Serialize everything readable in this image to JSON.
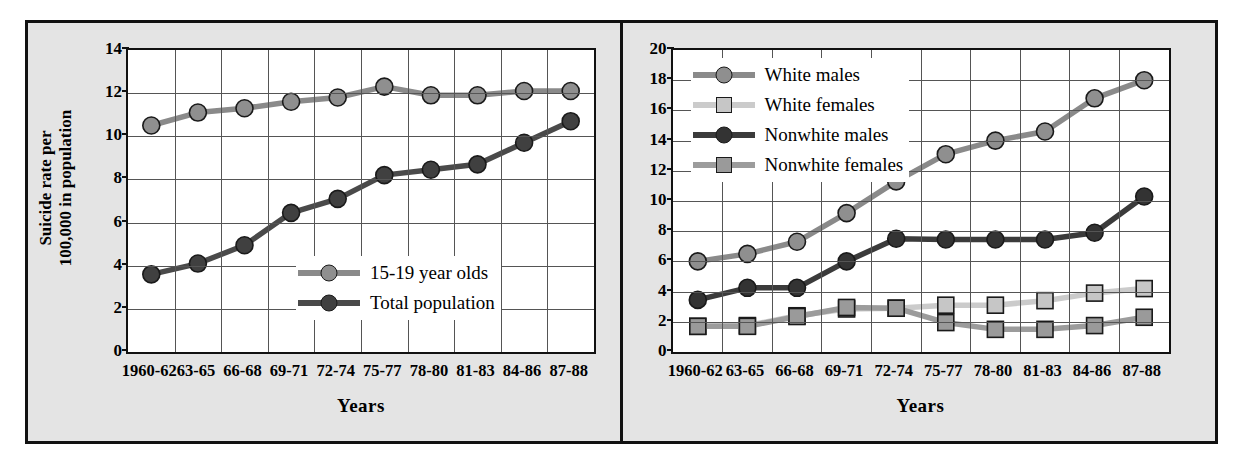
{
  "figure": {
    "background_color": "#e4e4e4",
    "border_color": "#111111",
    "plot_background": "#ffffff",
    "grid_color": "#555555"
  },
  "panels": [
    {
      "id": "left",
      "ylabel_line1": "Suicide rate per",
      "ylabel_line2": "100,000 in population",
      "xlabel": "Years"
    },
    {
      "id": "right",
      "xlabel": "Years"
    }
  ],
  "chart_data": [
    {
      "type": "line",
      "panel": "left",
      "title": "",
      "xlabel": "Years",
      "ylabel": "Suicide rate per 100,000 in population",
      "categories": [
        "1960-62",
        "63-65",
        "66-68",
        "69-71",
        "72-74",
        "75-77",
        "78-80",
        "81-83",
        "84-86",
        "87-88"
      ],
      "ylim": [
        0,
        14
      ],
      "yticks": [
        0,
        2,
        4,
        6,
        8,
        10,
        12,
        14
      ],
      "grid": true,
      "legend_position": "inside-bottom-right",
      "series": [
        {
          "name": "15-19 year olds",
          "color": "#8a8a8a",
          "marker": "circle",
          "marker_color": "#8f8f8f",
          "values": [
            10.5,
            11.1,
            11.3,
            11.6,
            11.8,
            12.3,
            11.9,
            11.9,
            12.1,
            12.1
          ]
        },
        {
          "name": "Total population",
          "color": "#4a4a4a",
          "marker": "circle",
          "marker_color": "#404040",
          "values": [
            3.6,
            4.1,
            4.95,
            6.45,
            7.1,
            8.2,
            8.45,
            8.7,
            9.7,
            10.7
          ]
        }
      ]
    },
    {
      "type": "line",
      "panel": "right",
      "title": "",
      "xlabel": "Years",
      "ylabel": "",
      "categories": [
        "1960-62",
        "63-65",
        "66-68",
        "69-71",
        "72-74",
        "75-77",
        "78-80",
        "81-83",
        "84-86",
        "87-88"
      ],
      "ylim": [
        0,
        20
      ],
      "yticks": [
        0,
        2,
        4,
        6,
        8,
        10,
        12,
        14,
        16,
        18,
        20
      ],
      "grid": true,
      "legend_position": "inside-top-left",
      "series": [
        {
          "name": "White males",
          "color": "#8a8a8a",
          "marker": "circle",
          "marker_color": "#8f8f8f",
          "values": [
            6.0,
            6.5,
            7.3,
            9.2,
            11.3,
            13.1,
            14.0,
            14.6,
            16.8,
            18.0
          ]
        },
        {
          "name": "White females",
          "color": "#cbcbcb",
          "marker": "square",
          "marker_color": "#c6c6c6",
          "values": [
            1.7,
            1.75,
            2.4,
            2.85,
            2.9,
            3.1,
            3.1,
            3.4,
            3.9,
            4.2
          ]
        },
        {
          "name": "Nonwhite males",
          "color": "#3b3b3b",
          "marker": "circle",
          "marker_color": "#333333",
          "values": [
            3.45,
            4.25,
            4.25,
            6.0,
            7.5,
            7.45,
            7.45,
            7.45,
            7.9,
            10.3
          ]
        },
        {
          "name": "Nonwhite females",
          "color": "#9c9c9c",
          "marker": "square",
          "marker_color": "#9a9a9a",
          "values": [
            1.7,
            1.7,
            2.35,
            2.95,
            2.9,
            1.95,
            1.5,
            1.5,
            1.75,
            2.3
          ]
        }
      ]
    }
  ]
}
